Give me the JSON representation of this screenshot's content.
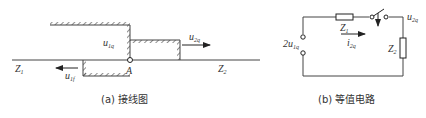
{
  "figure_a": {
    "line_left_label": "Z",
    "line_left_sub": "1",
    "line_right_label": "Z",
    "line_right_sub": "2",
    "incident_wave_label": "u",
    "incident_wave_sub": "1q",
    "refracted_wave_label": "u",
    "refracted_wave_sub": "2q",
    "reflected_wave_label": "u",
    "reflected_wave_sub": "1f",
    "junction_label": "A",
    "caption": "(a)  接线图"
  },
  "figure_b": {
    "source_label": "2u",
    "source_sub": "1q",
    "z1_label": "Z",
    "z1_sub": "1",
    "z2_label": "Z",
    "z2_sub": "2",
    "current_label": "i",
    "current_sub": "2q",
    "output_voltage_label": "u",
    "output_voltage_sub": "2q",
    "caption": "(b)  等值电路"
  }
}
